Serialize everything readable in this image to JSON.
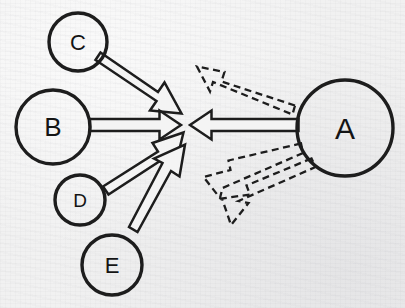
{
  "diagram": {
    "background_color": "#f1f1f1",
    "stroke_color": "#1d1d1d",
    "fill_color": "#f4f4f4",
    "width": 405,
    "height": 308,
    "convergence_point": {
      "x": 185,
      "y": 125
    },
    "nodes": [
      {
        "id": "A",
        "label": "A",
        "cx": 345,
        "cy": 128,
        "r": 48,
        "font_size": 30
      },
      {
        "id": "B",
        "label": "B",
        "cx": 53,
        "cy": 127,
        "r": 37,
        "font_size": 26
      },
      {
        "id": "C",
        "label": "C",
        "cx": 78,
        "cy": 42,
        "r": 29,
        "font_size": 22
      },
      {
        "id": "D",
        "label": "D",
        "cx": 80,
        "cy": 200,
        "r": 25,
        "font_size": 19
      },
      {
        "id": "E",
        "label": "E",
        "cx": 112,
        "cy": 265,
        "r": 30,
        "font_size": 22
      }
    ],
    "edges": [
      {
        "id": "c-to-center",
        "from": "C",
        "to": "center",
        "style": "solid",
        "direction": "inbound",
        "label": ""
      },
      {
        "id": "b-to-center",
        "from": "B",
        "to": "center",
        "style": "solid",
        "direction": "inbound",
        "label": ""
      },
      {
        "id": "d-to-center",
        "from": "D",
        "to": "center",
        "style": "solid",
        "direction": "inbound",
        "label": ""
      },
      {
        "id": "e-to-center",
        "from": "E",
        "to": "center",
        "style": "solid",
        "direction": "inbound",
        "label": ""
      },
      {
        "id": "a-to-center",
        "from": "A",
        "to": "center",
        "style": "solid",
        "direction": "inbound",
        "label": ""
      },
      {
        "id": "a-out-upper",
        "from": "A",
        "to": "upper-left",
        "style": "dashed",
        "direction": "outbound",
        "label": ""
      },
      {
        "id": "a-out-mid",
        "from": "A",
        "to": "middle-left",
        "style": "dashed",
        "direction": "outbound",
        "label": ""
      },
      {
        "id": "a-out-lower",
        "from": "A",
        "to": "lower-left",
        "style": "dashed",
        "direction": "outbound",
        "label": ""
      }
    ]
  }
}
